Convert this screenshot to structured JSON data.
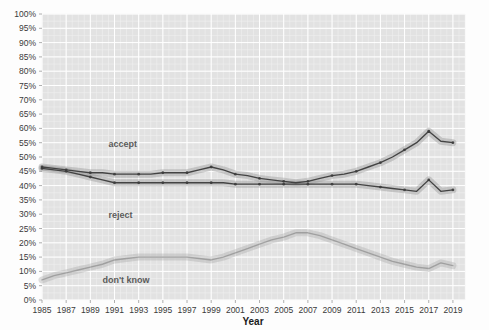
{
  "chart_data": {
    "type": "line",
    "title": "",
    "xlabel": "Year",
    "ylabel": "",
    "xlim": [
      1985,
      2020
    ],
    "ylim": [
      0,
      100
    ],
    "grid": true,
    "legend": "inline-labels",
    "x": [
      1985,
      1986,
      1987,
      1988,
      1989,
      1990,
      1991,
      1992,
      1993,
      1994,
      1995,
      1996,
      1997,
      1998,
      1999,
      2000,
      2001,
      2002,
      2003,
      2004,
      2005,
      2006,
      2007,
      2008,
      2009,
      2010,
      2011,
      2012,
      2013,
      2014,
      2015,
      2016,
      2017,
      2018,
      2019
    ],
    "xtick_labels": [
      "1985",
      "1987",
      "1989",
      "1991",
      "1993",
      "1995",
      "1997",
      "1999",
      "2001",
      "2003",
      "2005",
      "2007",
      "2009",
      "2011",
      "2013",
      "2015",
      "2017",
      "2019"
    ],
    "ytick_labels": [
      "0%",
      "5%",
      "10%",
      "15%",
      "20%",
      "25%",
      "30%",
      "35%",
      "40%",
      "45%",
      "50%",
      "55%",
      "60%",
      "65%",
      "70%",
      "75%",
      "80%",
      "85%",
      "90%",
      "95%",
      "100%"
    ],
    "series": [
      {
        "name": "accept",
        "label": "accept",
        "color": "#3c3c3c",
        "band_color": "#8f8f8f",
        "values": [
          46.5,
          46.0,
          45.5,
          45.0,
          44.5,
          44.5,
          44.0,
          44.0,
          44.0,
          44.0,
          44.5,
          44.5,
          44.5,
          45.5,
          46.5,
          45.5,
          44.0,
          43.5,
          42.5,
          42.0,
          41.5,
          41.0,
          41.5,
          42.5,
          43.5,
          44.0,
          45.0,
          46.5,
          48.0,
          50.0,
          52.5,
          55.0,
          59.0,
          55.5,
          55.0
        ]
      },
      {
        "name": "reject",
        "label": "reject",
        "color": "#3c3c3c",
        "band_color": "#8f8f8f",
        "values": [
          46.0,
          45.5,
          45.0,
          44.0,
          43.0,
          42.0,
          41.0,
          41.0,
          41.0,
          41.0,
          41.0,
          41.0,
          41.0,
          41.0,
          41.0,
          41.0,
          40.5,
          40.5,
          40.5,
          40.5,
          40.5,
          40.5,
          40.5,
          40.5,
          40.5,
          40.5,
          40.5,
          40.0,
          39.5,
          39.0,
          38.5,
          38.0,
          42.0,
          38.0,
          38.5
        ]
      },
      {
        "name": "don't know",
        "label": "don't know",
        "color": "#7a7a7a",
        "band_color": "#a8a8a8",
        "values": [
          7.0,
          8.5,
          9.5,
          10.5,
          11.5,
          12.5,
          14.0,
          14.5,
          15.0,
          15.0,
          15.0,
          15.0,
          15.0,
          14.5,
          14.0,
          15.0,
          16.5,
          18.0,
          19.5,
          21.0,
          22.0,
          23.5,
          23.5,
          22.5,
          21.0,
          19.5,
          18.0,
          16.5,
          15.0,
          13.5,
          12.5,
          11.5,
          11.0,
          13.0,
          12.0
        ]
      }
    ],
    "series_label_positions": [
      {
        "name": "accept",
        "x": 1990.5,
        "y": 53.5
      },
      {
        "name": "reject",
        "x": 1990.5,
        "y": 28.5
      },
      {
        "name": "don't know",
        "x": 1990.0,
        "y": 6.0
      }
    ],
    "colors": {
      "plot_background": "#e2e2e2",
      "page_background": "#fdfdfd",
      "grid": "#ffffff",
      "axis_text": "#3a3a3a",
      "label_text": "#5b5b5b"
    }
  }
}
